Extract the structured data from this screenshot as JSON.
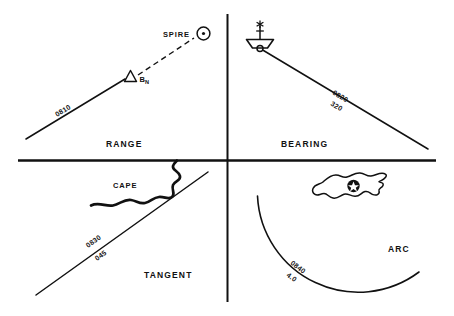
{
  "figure": {
    "background_color": "#ffffff",
    "ink_color": "#111111",
    "width": 454,
    "height": 316
  },
  "divider": {
    "name": "quadrant-cross-divider",
    "horizontal_y": 160,
    "vertical_x": 227
  },
  "quadrants": [
    {
      "id": "range",
      "label": "RANGE",
      "position": "top-left",
      "lop_type": "range",
      "lop_time": "0810",
      "lop_value": "",
      "objects": [
        {
          "symbol": "spire-circle-dot",
          "label": "SPIRE"
        },
        {
          "symbol": "beacon-triangle",
          "label": "B",
          "sublabel": "N"
        }
      ],
      "line_style": "solid",
      "sight_line_style": "dashed"
    },
    {
      "id": "bearing",
      "label": "BEARING",
      "position": "top-right",
      "lop_type": "bearing",
      "lop_time": "0820",
      "lop_value": "320",
      "objects": [
        {
          "symbol": "lightship",
          "label": ""
        }
      ],
      "line_style": "solid"
    },
    {
      "id": "tangent",
      "label": "TANGENT",
      "position": "bottom-left",
      "lop_type": "tangent",
      "lop_time": "0830",
      "lop_value": "045",
      "objects": [
        {
          "symbol": "coastline-cape",
          "label": "CAPE"
        }
      ],
      "line_style": "solid"
    },
    {
      "id": "arc",
      "label": "ARC",
      "position": "bottom-right",
      "lop_type": "distance-arc",
      "lop_time": "0840",
      "lop_value": "4.0",
      "objects": [
        {
          "symbol": "island-outline",
          "label": ""
        },
        {
          "symbol": "radiobeacon-star",
          "label": ""
        }
      ],
      "line_style": "solid-arc"
    }
  ]
}
